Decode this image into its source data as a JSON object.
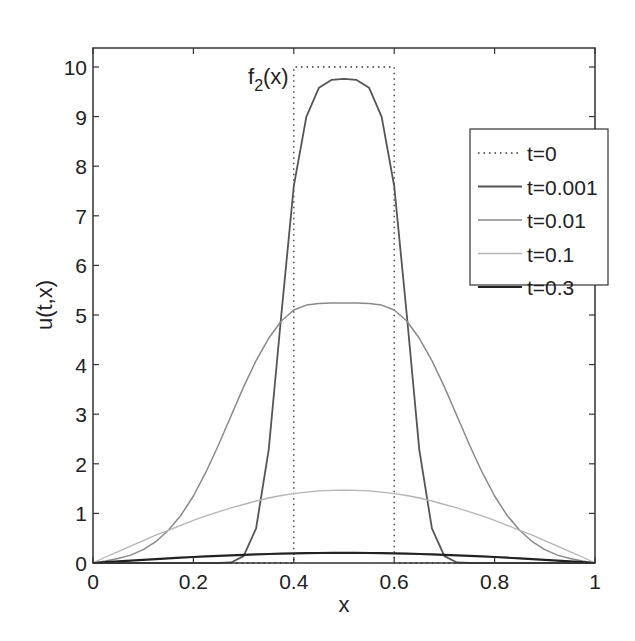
{
  "chart_data": {
    "type": "line",
    "title": "",
    "xlabel": "x",
    "ylabel": "u(t,x)",
    "xlim": [
      0,
      1
    ],
    "ylim": [
      0,
      10.4
    ],
    "grid": false,
    "legend_position": "upper right",
    "annotation": {
      "text": "f",
      "sub": "2",
      "suffix": "(x)",
      "x": 0.31,
      "y": 9.75
    },
    "xticks": [
      0,
      0.2,
      0.4,
      0.6,
      0.8,
      1
    ],
    "xtick_labels": [
      "0",
      "0.2",
      "0.4",
      "0.6",
      "0.8",
      "1"
    ],
    "yticks": [
      0,
      1,
      2,
      3,
      4,
      5,
      6,
      7,
      8,
      9,
      10
    ],
    "ytick_labels": [
      "0",
      "1",
      "2",
      "3",
      "4",
      "5",
      "6",
      "7",
      "8",
      "9",
      "10"
    ],
    "x": [
      0,
      0.025,
      0.05,
      0.075,
      0.1,
      0.125,
      0.15,
      0.175,
      0.2,
      0.225,
      0.25,
      0.275,
      0.3,
      0.325,
      0.35,
      0.375,
      0.4,
      0.425,
      0.45,
      0.475,
      0.5,
      0.525,
      0.55,
      0.575,
      0.6,
      0.625,
      0.65,
      0.675,
      0.7,
      0.725,
      0.75,
      0.775,
      0.8,
      0.825,
      0.85,
      0.875,
      0.9,
      0.925,
      0.95,
      0.975,
      1
    ],
    "series": [
      {
        "name": "t=0",
        "style": "dotted",
        "color": "#333333",
        "width": 1.3,
        "x": [
          0,
          0.4,
          0.4,
          0.6,
          0.6,
          1
        ],
        "values": [
          0,
          0,
          10,
          10,
          0,
          0
        ]
      },
      {
        "name": "t=0.001",
        "style": "solid",
        "color": "#555555",
        "width": 1.8,
        "values": [
          0,
          0,
          0,
          0,
          0,
          0,
          0,
          0,
          0,
          0,
          0.001,
          0.01,
          0.14,
          0.7,
          2.28,
          5.0,
          7.6,
          9.0,
          9.58,
          9.74,
          9.76,
          9.74,
          9.58,
          9.0,
          7.6,
          5.0,
          2.28,
          0.7,
          0.14,
          0.01,
          0.001,
          0,
          0,
          0,
          0,
          0,
          0,
          0,
          0,
          0,
          0
        ]
      },
      {
        "name": "t=0.01",
        "style": "solid",
        "color": "#8a8a8a",
        "width": 1.5,
        "values": [
          0,
          0.04,
          0.09,
          0.16,
          0.27,
          0.43,
          0.66,
          0.96,
          1.35,
          1.83,
          2.38,
          2.97,
          3.55,
          4.08,
          4.53,
          4.88,
          5.1,
          5.2,
          5.23,
          5.24,
          5.24,
          5.24,
          5.23,
          5.2,
          5.1,
          4.88,
          4.53,
          4.08,
          3.55,
          2.97,
          2.38,
          1.83,
          1.35,
          0.96,
          0.66,
          0.43,
          0.27,
          0.16,
          0.09,
          0.04,
          0
        ]
      },
      {
        "name": "t=0.1",
        "style": "solid",
        "color": "#b5b5b5",
        "width": 1.3,
        "values": [
          0,
          0.12,
          0.23,
          0.34,
          0.45,
          0.56,
          0.66,
          0.76,
          0.86,
          0.95,
          1.03,
          1.11,
          1.18,
          1.25,
          1.31,
          1.36,
          1.4,
          1.43,
          1.455,
          1.465,
          1.47,
          1.465,
          1.455,
          1.43,
          1.4,
          1.36,
          1.31,
          1.25,
          1.18,
          1.11,
          1.03,
          0.95,
          0.86,
          0.76,
          0.66,
          0.56,
          0.45,
          0.34,
          0.23,
          0.12,
          0
        ]
      },
      {
        "name": "t=0.3",
        "style": "solid",
        "color": "#222222",
        "width": 2.2,
        "values": [
          0,
          0.016,
          0.032,
          0.047,
          0.063,
          0.078,
          0.093,
          0.107,
          0.12,
          0.133,
          0.145,
          0.156,
          0.165,
          0.174,
          0.182,
          0.189,
          0.194,
          0.198,
          0.201,
          0.203,
          0.204,
          0.203,
          0.201,
          0.198,
          0.194,
          0.189,
          0.182,
          0.174,
          0.165,
          0.156,
          0.145,
          0.133,
          0.12,
          0.107,
          0.093,
          0.078,
          0.063,
          0.047,
          0.032,
          0.016,
          0
        ]
      }
    ]
  }
}
